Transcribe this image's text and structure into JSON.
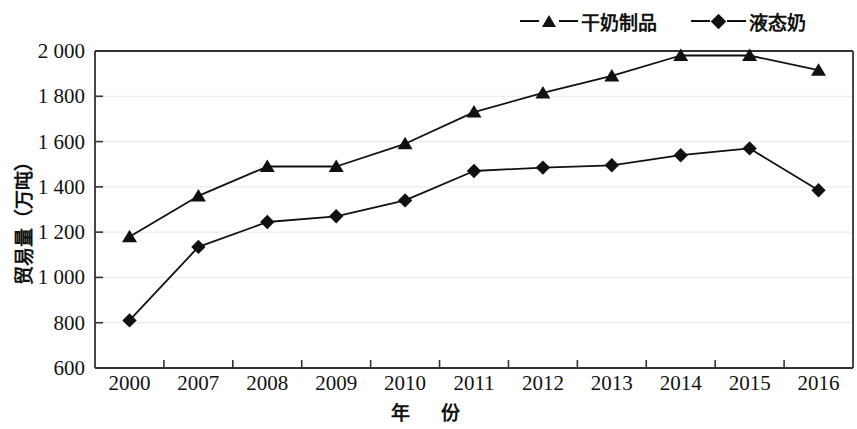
{
  "chart_data": {
    "type": "line",
    "title": "",
    "xlabel": "年　份",
    "ylabel": "贸易量（万吨）",
    "categories": [
      "2000",
      "2007",
      "2008",
      "2009",
      "2010",
      "2011",
      "2012",
      "2013",
      "2014",
      "2015",
      "2016"
    ],
    "ylim": [
      600,
      2000
    ],
    "ytick_labels": [
      "2 000",
      "1 800",
      "1 600",
      "1 400",
      "1 200",
      "1 000",
      "800",
      "600"
    ],
    "ytick_values": [
      2000,
      1800,
      1600,
      1400,
      1200,
      1000,
      800,
      600
    ],
    "grid": true,
    "legend_position": "top-right",
    "series": [
      {
        "name": "干奶制品",
        "marker": "triangle",
        "color": "#111111",
        "values": [
          1180,
          1360,
          1490,
          1490,
          1590,
          1730,
          1815,
          1890,
          1980,
          1980,
          1915
        ]
      },
      {
        "name": "液态奶",
        "marker": "diamond",
        "color": "#111111",
        "values": [
          810,
          1135,
          1245,
          1270,
          1340,
          1470,
          1485,
          1495,
          1540,
          1570,
          1385
        ]
      }
    ]
  },
  "legend": {
    "entries": [
      {
        "label": "干奶制品",
        "marker": "triangle"
      },
      {
        "label": "液态奶",
        "marker": "diamond"
      }
    ]
  },
  "colors": {
    "ink": "#111111",
    "grid": "#e8e8e8",
    "axis": "#333333",
    "background": "#ffffff"
  }
}
